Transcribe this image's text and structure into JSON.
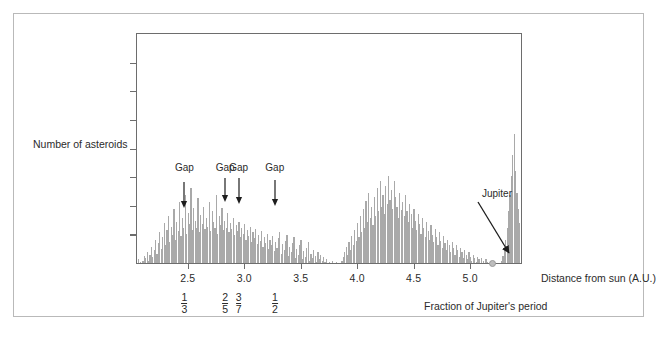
{
  "figure": {
    "y_axis_label": "Number of asteroids",
    "x_axis_title": "Distance from sun (A.U.)",
    "secondary_axis_title": "Fraction of Jupiter's period",
    "jupiter_label": "Jupiter",
    "gap_label": "Gap"
  },
  "chart_data": {
    "type": "bar",
    "title": "",
    "xlabel": "Distance from sun (A.U.)",
    "ylabel": "Number of asteroids",
    "xlim": [
      2.05,
      5.45
    ],
    "ylim": [
      0,
      100
    ],
    "grid": false,
    "legend": null,
    "xticks": [
      2.5,
      3.0,
      3.5,
      4.0,
      4.5,
      5.0
    ],
    "xtick_labels": [
      "2.5",
      "3.0",
      "3.5",
      "4.0",
      "4.5",
      "5.0"
    ],
    "yticks_count": 7,
    "ytick_labels": [],
    "bin_width": 0.0125,
    "x_start": 2.06,
    "values": [
      3,
      1,
      0,
      2,
      6,
      4,
      9,
      2,
      7,
      14,
      5,
      11,
      20,
      8,
      17,
      26,
      12,
      22,
      34,
      15,
      28,
      40,
      18,
      31,
      24,
      46,
      20,
      35,
      27,
      52,
      23,
      38,
      30,
      58,
      25,
      43,
      33,
      64,
      28,
      47,
      36,
      30,
      55,
      26,
      41,
      33,
      48,
      29,
      38,
      31,
      52,
      27,
      44,
      35,
      30,
      58,
      25,
      40,
      32,
      47,
      28,
      36,
      30,
      43,
      26,
      34,
      29,
      38,
      24,
      32,
      27,
      35,
      22,
      30,
      25,
      33,
      20,
      28,
      23,
      31,
      18,
      26,
      21,
      29,
      16,
      24,
      19,
      27,
      14,
      22,
      17,
      25,
      12,
      20,
      15,
      23,
      10,
      18,
      13,
      21,
      26,
      8,
      16,
      11,
      19,
      24,
      6,
      14,
      9,
      17,
      22,
      4,
      12,
      7,
      15,
      20,
      3,
      10,
      5,
      13,
      18,
      2,
      8,
      4,
      11,
      6,
      1,
      9,
      3,
      7,
      2,
      5,
      1,
      3,
      0,
      1,
      0,
      2,
      0,
      0,
      1,
      0,
      0,
      0,
      2,
      5,
      9,
      14,
      7,
      18,
      11,
      23,
      15,
      28,
      19,
      34,
      22,
      40,
      26,
      46,
      30,
      53,
      35,
      60,
      38,
      48,
      32,
      56,
      40,
      64,
      44,
      70,
      48,
      58,
      42,
      66,
      50,
      74,
      54,
      62,
      46,
      70,
      56,
      48,
      38,
      60,
      45,
      52,
      40,
      58,
      44,
      35,
      50,
      42,
      30,
      46,
      36,
      28,
      42,
      33,
      25,
      38,
      30,
      22,
      35,
      27,
      20,
      32,
      24,
      18,
      29,
      22,
      15,
      26,
      19,
      13,
      23,
      17,
      11,
      20,
      15,
      9,
      18,
      13,
      7,
      15,
      11,
      5,
      13,
      9,
      4,
      11,
      7,
      3,
      9,
      5,
      2,
      7,
      4,
      1,
      5,
      3,
      0,
      4,
      2,
      0,
      3,
      1,
      0,
      2,
      0,
      0,
      1,
      0,
      0,
      0,
      0,
      2,
      6,
      12,
      20,
      30,
      44,
      58,
      74,
      92,
      110,
      78,
      60,
      46,
      34,
      24,
      16,
      10,
      6,
      3,
      1,
      0,
      0,
      2,
      7,
      16,
      28,
      44,
      62,
      80,
      96,
      112,
      128,
      145,
      160,
      175,
      190,
      168,
      150,
      132,
      118,
      100,
      86,
      72,
      60,
      50,
      40,
      32,
      25,
      19,
      14,
      10,
      7,
      5,
      3,
      2,
      1,
      0,
      0,
      1,
      3,
      6,
      10,
      15,
      21,
      28,
      36,
      45,
      55,
      66,
      58,
      50,
      43,
      37,
      31,
      26,
      22,
      18,
      15,
      12,
      10,
      8,
      6,
      5,
      4,
      3,
      2,
      2,
      1,
      1,
      0,
      0,
      0,
      1,
      0,
      0,
      2,
      1,
      0,
      0,
      1,
      0,
      0,
      0,
      0,
      1,
      2,
      4,
      7,
      11,
      16,
      22,
      29,
      24,
      19,
      15,
      12,
      9,
      7,
      5,
      4,
      3,
      2,
      1,
      1,
      0,
      0,
      1,
      0,
      0,
      0,
      0,
      0,
      0,
      1,
      0,
      0,
      0,
      0,
      0,
      2,
      1,
      0,
      0,
      0,
      1,
      0,
      0,
      0,
      0,
      0,
      0,
      3,
      1,
      0,
      0,
      0,
      0,
      0,
      0,
      0,
      0,
      0,
      1,
      0,
      0,
      0,
      0,
      0,
      0,
      0,
      0,
      0,
      0,
      0,
      0,
      0,
      0,
      0,
      0,
      0,
      0,
      0,
      0,
      0,
      0,
      0,
      0,
      0,
      0,
      0,
      0,
      0,
      0,
      0,
      0,
      0,
      0,
      0,
      0,
      0,
      0,
      0,
      0,
      0,
      0,
      0,
      0
    ],
    "annotations": {
      "gaps": [
        {
          "label": "Gap",
          "x": 2.47,
          "fraction_num": "1",
          "fraction_den": "3"
        },
        {
          "label": "Gap",
          "x": 2.83,
          "fraction_num": "2",
          "fraction_den": "5"
        },
        {
          "label": "Gap",
          "x": 2.95,
          "fraction_num": "3",
          "fraction_den": "7"
        },
        {
          "label": "Gap",
          "x": 3.27,
          "fraction_num": "1",
          "fraction_den": "2"
        }
      ],
      "jupiter": {
        "label": "Jupiter",
        "x": 5.2,
        "y": 0
      }
    }
  },
  "colors": {
    "bar": "#a9a9a9",
    "axis": "#6d6d6d",
    "text": "#2b2b2b",
    "frame": "#b9b9b9",
    "jupiter_dot": "#bdbdbd"
  }
}
